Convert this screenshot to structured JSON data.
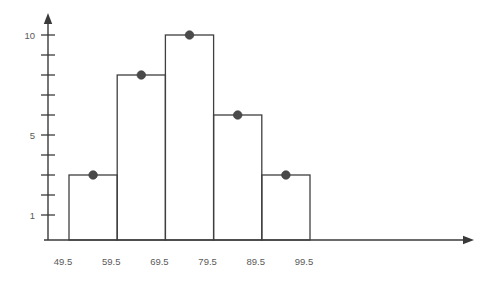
{
  "chart_data": {
    "type": "bar",
    "title": "",
    "subtitle": "",
    "xlabel": "",
    "ylabel": "",
    "grid": false,
    "legend": null,
    "style": "histogram-with-midpoint-dots",
    "categories": [
      "49.5-59.5",
      "59.5-69.5",
      "69.5-79.5",
      "79.5-89.5",
      "89.5-99.5"
    ],
    "bin_edges": [
      49.5,
      59.5,
      69.5,
      79.5,
      89.5,
      99.5
    ],
    "values": [
      3,
      8,
      10,
      6,
      3
    ],
    "midpoints": [
      54.5,
      64.5,
      74.5,
      84.5,
      94.5
    ],
    "xlim": [
      49.5,
      99.5
    ],
    "ylim": [
      0,
      10
    ],
    "x_tick_labels": [
      "49.5",
      "59.5",
      "69.5",
      "79.5",
      "89.5",
      "99.5"
    ],
    "y_tick_values": [
      1,
      2,
      3,
      4,
      5,
      6,
      7,
      8,
      9,
      10
    ],
    "y_labeled_ticks": [
      {
        "value": 10,
        "label": "10"
      },
      {
        "value": 5,
        "label": "5"
      },
      {
        "value": 1,
        "label": "1"
      }
    ],
    "colors": {
      "bar_stroke": "#3f3f3f",
      "dot_fill": "#4a4a4a",
      "axis": "#3a3a3a",
      "tick_label": "#5a5a5a",
      "background": "#ffffff"
    }
  }
}
